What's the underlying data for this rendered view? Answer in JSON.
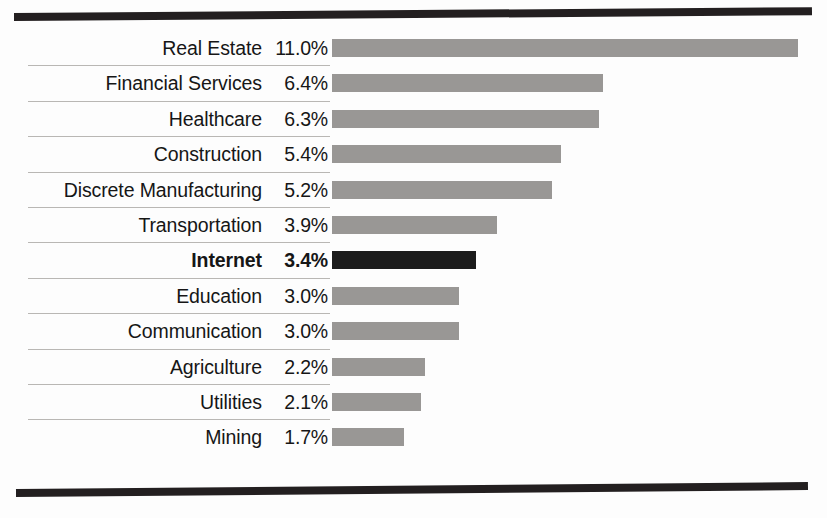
{
  "figure": {
    "accent_bar_color": "#999795",
    "highlight_bar_color": "#1b1b1b",
    "rule_color": "#231f20",
    "separator_color": "#b9b7b4",
    "highlight_category": "Internet",
    "caption_fragment": ""
  },
  "chart_data": {
    "type": "bar",
    "orientation": "horizontal",
    "title": "",
    "subtitle": "",
    "xlabel": "",
    "ylabel": "",
    "grid": false,
    "legend": null,
    "value_suffix": "%",
    "xlim": [
      0,
      11.0
    ],
    "categories": [
      "Real Estate",
      "Financial Services",
      "Healthcare",
      "Construction",
      "Discrete Manufacturing",
      "Transportation",
      "Internet",
      "Education",
      "Communication",
      "Agriculture",
      "Utilities",
      "Mining"
    ],
    "values": [
      11.0,
      6.4,
      6.3,
      5.4,
      5.2,
      3.9,
      3.4,
      3.0,
      3.0,
      2.2,
      2.1,
      1.7
    ],
    "value_labels": [
      "11.0%",
      "6.4%",
      "6.3%",
      "5.4%",
      "5.2%",
      "3.9%",
      "3.4%",
      "3.0%",
      "3.0%",
      "2.2%",
      "2.1%",
      "1.7%"
    ],
    "highlighted": [
      false,
      false,
      false,
      false,
      false,
      false,
      true,
      false,
      false,
      false,
      false,
      false
    ],
    "rows": [
      {
        "label": "Real Estate",
        "value": 11.0,
        "value_label": "11.0%",
        "highlight": false
      },
      {
        "label": "Financial Services",
        "value": 6.4,
        "value_label": "6.4%",
        "highlight": false
      },
      {
        "label": "Healthcare",
        "value": 6.3,
        "value_label": "6.3%",
        "highlight": false
      },
      {
        "label": "Construction",
        "value": 5.4,
        "value_label": "5.4%",
        "highlight": false
      },
      {
        "label": "Discrete Manufacturing",
        "value": 5.2,
        "value_label": "5.2%",
        "highlight": false
      },
      {
        "label": "Transportation",
        "value": 3.9,
        "value_label": "3.9%",
        "highlight": false
      },
      {
        "label": "Internet",
        "value": 3.4,
        "value_label": "3.4%",
        "highlight": true
      },
      {
        "label": "Education",
        "value": 3.0,
        "value_label": "3.0%",
        "highlight": false
      },
      {
        "label": "Communication",
        "value": 3.0,
        "value_label": "3.0%",
        "highlight": false
      },
      {
        "label": "Agriculture",
        "value": 2.2,
        "value_label": "2.2%",
        "highlight": false
      },
      {
        "label": "Utilities",
        "value": 2.1,
        "value_label": "2.1%",
        "highlight": false
      },
      {
        "label": "Mining",
        "value": 1.7,
        "value_label": "1.7%",
        "highlight": false
      }
    ]
  }
}
